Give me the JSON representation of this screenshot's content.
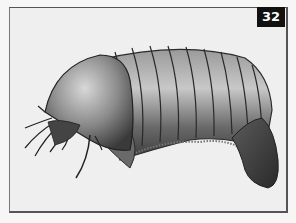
{
  "figure": {
    "number_label": "32",
    "colors": {
      "background": "#efefef",
      "frame_border": "#555555",
      "badge_bg": "#111111",
      "badge_text": "#ffffff",
      "ink": "#2a2a2a"
    }
  }
}
